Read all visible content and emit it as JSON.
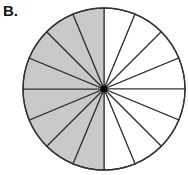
{
  "figure": {
    "label": "B.",
    "circle": {
      "cx": 104,
      "cy": 89,
      "r": 81,
      "total_slices": 16,
      "shaded_slices": 8,
      "shaded_side": "left",
      "fraction_shaded": "8/16"
    },
    "colors": {
      "shaded": "#c9c9c9",
      "unshaded": "#ffffff",
      "stroke": "#333333",
      "center_dot": "#000000"
    }
  }
}
